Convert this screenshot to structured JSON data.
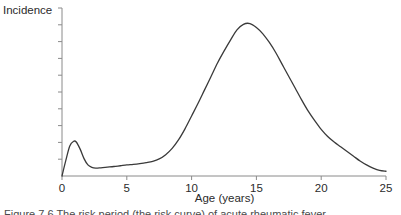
{
  "figure": {
    "ylabel": "Incidence",
    "xlabel": "Age (years)",
    "caption": "Figure 7.6 The risk period (the risk curve) of acute rheumatic fever"
  },
  "axes": {
    "x_ticks": [
      "0",
      "5",
      "10",
      "15",
      "20",
      "25"
    ],
    "y_tick_count": 10,
    "line_color": "#8a8a8a",
    "curve_color": "#3a3a3a"
  },
  "chart_data": {
    "type": "line",
    "title": "",
    "xlabel": "Age (years)",
    "ylabel": "Incidence",
    "xlim": [
      0,
      25
    ],
    "ylim": [
      0,
      1.0
    ],
    "xticks": [
      0,
      5,
      10,
      15,
      20,
      25
    ],
    "yticks": [],
    "grid": false,
    "legend": null,
    "series": [
      {
        "name": "Incidence",
        "x": [
          0,
          0.3,
          0.6,
          0.9,
          1.1,
          1.4,
          1.7,
          2.0,
          2.3,
          2.6,
          3.0,
          3.5,
          4.0,
          4.5,
          5.0,
          5.5,
          6.0,
          6.5,
          7.0,
          7.5,
          8.0,
          8.5,
          9.0,
          9.5,
          10.0,
          10.5,
          11.0,
          11.5,
          12.0,
          12.5,
          13.0,
          13.5,
          14.0,
          14.5,
          15.0,
          15.5,
          16.0,
          16.5,
          17.0,
          17.5,
          18.0,
          18.5,
          19.0,
          19.5,
          20.0,
          20.5,
          21.0,
          21.5,
          22.0,
          22.5,
          23.0,
          23.5,
          24.0,
          24.5,
          25.0
        ],
        "y": [
          0.0,
          0.1,
          0.19,
          0.22,
          0.215,
          0.17,
          0.11,
          0.07,
          0.055,
          0.05,
          0.052,
          0.056,
          0.06,
          0.065,
          0.07,
          0.074,
          0.079,
          0.085,
          0.093,
          0.108,
          0.135,
          0.175,
          0.23,
          0.3,
          0.38,
          0.46,
          0.545,
          0.63,
          0.715,
          0.79,
          0.86,
          0.925,
          0.96,
          0.965,
          0.94,
          0.9,
          0.845,
          0.78,
          0.705,
          0.63,
          0.555,
          0.48,
          0.41,
          0.35,
          0.295,
          0.25,
          0.215,
          0.185,
          0.155,
          0.125,
          0.095,
          0.07,
          0.05,
          0.035,
          0.03
        ]
      }
    ],
    "annotations": [
      {
        "label": "infant peak",
        "x": 1.0,
        "y": 0.22
      },
      {
        "label": "main peak",
        "x": 14.3,
        "y": 0.965
      }
    ]
  }
}
